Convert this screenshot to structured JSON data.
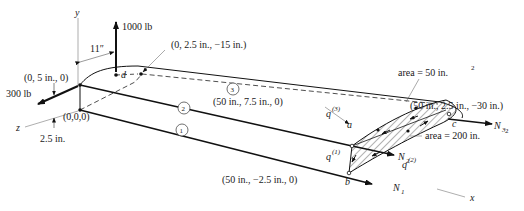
{
  "axes": {
    "x": "x",
    "y": "y",
    "z": "z"
  },
  "loads": {
    "vertical_force": "1000 lb",
    "horizontal_force": "300 lb",
    "offset_dimension": "11″",
    "height_dimension": "2.5 in."
  },
  "points": {
    "origin": "(0,0,0)",
    "top_front": "(0, 5 in., 0)",
    "d_point_coord": "(0, 2.5 in., −15 in.)",
    "a_coord": "(50 in., 7.5 in., 0)",
    "b_coord": "(50 in., −2.5 in., 0)",
    "c_coord": "(50 in., 2.5 in., −30 in.)"
  },
  "point_labels": {
    "a": "a",
    "b": "b",
    "c": "c",
    "d": "d"
  },
  "members": [
    {
      "id": "1",
      "force": "N",
      "sub": "1"
    },
    {
      "id": "2",
      "force": "N",
      "sub": "2"
    },
    {
      "id": "3",
      "force": "N",
      "sub": "3"
    }
  ],
  "shear_flows": [
    {
      "symbol": "q",
      "sup": "(1)"
    },
    {
      "symbol": "q",
      "sup": "(2)"
    },
    {
      "symbol": "q",
      "sup": "(3)"
    }
  ],
  "areas": {
    "upper": "area = 50 in.",
    "lower": "area = 200 in.",
    "exp": "2"
  }
}
